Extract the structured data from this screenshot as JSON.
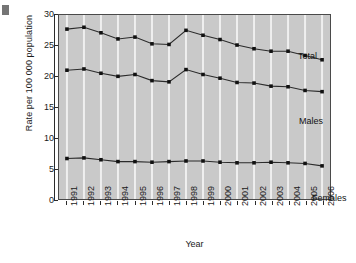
{
  "figure": {
    "name": "rate-trend-line-chart",
    "corner_artifact": "page-corner-mark"
  },
  "axes": {
    "y_title": "Rate per 100 000  population",
    "x_title": "Year",
    "y_ticks": [
      "0",
      "5",
      "10",
      "15",
      "20",
      "25",
      "30"
    ],
    "x_ticks": [
      "1991",
      "1992",
      "1993",
      "1994",
      "1995",
      "1996",
      "1997",
      "1998",
      "1999",
      "2000",
      "2001",
      "2002",
      "2003",
      "2004",
      "2005",
      "2006"
    ]
  },
  "annotations": {
    "total": "Total",
    "males": "Males",
    "females": "Females"
  },
  "colors": {
    "plot_background": "#c9c9c9",
    "gridline": "#efefef",
    "series_line": "#2b2b2b",
    "marker": "#111111",
    "frame": "#4a4a4a"
  },
  "chart_data": {
    "type": "line",
    "title": "",
    "subtitle": "",
    "xlabel": "Year",
    "ylabel": "Rate per 100 000  population",
    "x": [
      1991,
      1992,
      1993,
      1994,
      1995,
      1996,
      1997,
      1998,
      1999,
      2000,
      2001,
      2002,
      2003,
      2004,
      2005,
      2006
    ],
    "categories": [
      "1991",
      "1992",
      "1993",
      "1994",
      "1995",
      "1996",
      "1997",
      "1998",
      "1999",
      "2000",
      "2001",
      "2002",
      "2003",
      "2004",
      "2005",
      "2006"
    ],
    "series": [
      {
        "name": "Total",
        "label_position": "inside-upper-right",
        "values": [
          27.7,
          28.0,
          27.1,
          26.1,
          26.4,
          25.3,
          25.2,
          27.5,
          26.7,
          26.0,
          25.1,
          24.5,
          24.1,
          24.1,
          23.4,
          22.7
        ]
      },
      {
        "name": "Males",
        "label_position": "inside-middle-right",
        "values": [
          21.0,
          21.2,
          20.5,
          20.0,
          20.3,
          19.3,
          19.1,
          21.1,
          20.3,
          19.7,
          19.0,
          18.9,
          18.4,
          18.3,
          17.7,
          17.5
        ]
      },
      {
        "name": "Females",
        "label_position": "inside-lower-right",
        "values": [
          6.6,
          6.7,
          6.4,
          6.1,
          6.1,
          6.0,
          6.1,
          6.2,
          6.2,
          6.0,
          5.9,
          5.9,
          6.0,
          5.9,
          5.8,
          5.4
        ]
      }
    ],
    "ylim": [
      0,
      30
    ],
    "ytick_step": 5,
    "grid": "vertical-only",
    "legend": "inline-series-labels",
    "markers": "filled-square"
  }
}
